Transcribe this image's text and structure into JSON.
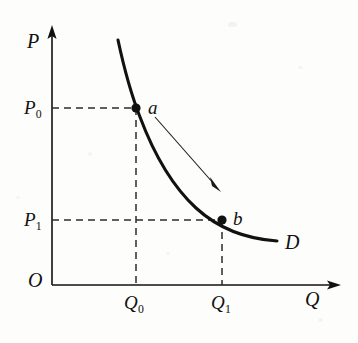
{
  "figure": {
    "background_color": "#fdfdfb",
    "ink_color": "#111111",
    "width": 358,
    "height": 343
  },
  "axes": {
    "y_axis": {
      "label": "P",
      "name": "price-axis",
      "x": 52,
      "y_top": 28,
      "y_bottom": 285,
      "arrow": true
    },
    "x_axis": {
      "label": "Q",
      "name": "quantity-axis",
      "y": 285,
      "x_left": 52,
      "x_right": 340,
      "arrow": true
    },
    "origin": {
      "label": "O",
      "x": 52,
      "y": 285
    }
  },
  "ticks": {
    "price": [
      {
        "label": "P",
        "sub": "0",
        "value_y": 108
      },
      {
        "label": "P",
        "sub": "1",
        "value_y": 220
      }
    ],
    "quantity": [
      {
        "label": "Q",
        "sub": "0",
        "value_x": 136
      },
      {
        "label": "Q",
        "sub": "1",
        "value_x": 222
      }
    ]
  },
  "curve": {
    "label": "D",
    "name": "demand-curve",
    "stroke_width": 3.1,
    "path": "M 118 40 C 124 68, 131 94, 140 117 C 152 149, 170 184, 196 208 C 220 230, 248 239, 277 241"
  },
  "points": [
    {
      "id": "a",
      "label": "a",
      "x": 136,
      "y": 108,
      "label_x": 149,
      "label_y": 101
    },
    {
      "id": "b",
      "label": "b",
      "x": 222,
      "y": 220,
      "label_x": 234,
      "label_y": 212
    }
  ],
  "annotation_arrow": {
    "name": "movement-arrow",
    "from_x": 155,
    "from_y": 117,
    "to_x": 219,
    "to_y": 189,
    "stroke_width": 1.1
  },
  "guides": [
    {
      "name": "guide-p0-horizontal",
      "x1": 52,
      "y1": 108,
      "x2": 136,
      "y2": 108
    },
    {
      "name": "guide-p1-horizontal",
      "x1": 52,
      "y1": 220,
      "x2": 222,
      "y2": 220
    },
    {
      "name": "guide-q0-vertical",
      "x1": 136,
      "y1": 108,
      "x2": 136,
      "y2": 285
    },
    {
      "name": "guide-q1-vertical",
      "x1": 222,
      "y1": 220,
      "x2": 222,
      "y2": 285
    }
  ],
  "chart_data": {
    "type": "line",
    "xlabel": "Q",
    "ylabel": "P",
    "grid": false,
    "legend": "none",
    "annotations": [
      "D",
      "a",
      "b",
      "arrow from a to b indicating movement along the demand curve"
    ],
    "axis_tick_labels": {
      "x": [
        "Q0",
        "Q1"
      ],
      "y": [
        "P0",
        "P1"
      ]
    },
    "series": [
      {
        "name": "D",
        "kind": "demand-curve",
        "x": [
          0.22,
          0.28,
          0.34,
          0.42,
          0.52,
          0.63,
          0.74,
          0.85,
          0.96
        ],
        "y": [
          0.95,
          0.79,
          0.68,
          0.56,
          0.45,
          0.35,
          0.27,
          0.22,
          0.19
        ]
      }
    ],
    "marked_points": [
      {
        "label": "a",
        "x": "Q0",
        "y": "P0"
      },
      {
        "label": "b",
        "x": "Q1",
        "y": "P1"
      }
    ],
    "ordering": {
      "x": "Q0 < Q1",
      "y": "P1 < P0"
    }
  }
}
